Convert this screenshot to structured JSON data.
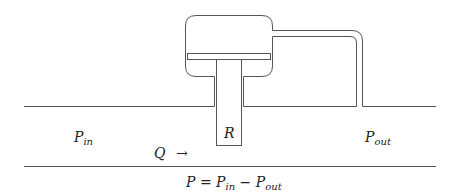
{
  "diagram": {
    "labels": {
      "p_in": {
        "base": "P",
        "sub": "in"
      },
      "p_out": {
        "base": "P",
        "sub": "out"
      },
      "resistance": "R",
      "flow": "Q",
      "flow_arrow": "→"
    },
    "equation": {
      "lhs": "P",
      "equals": "=",
      "term1_base": "P",
      "term1_sub": "in",
      "minus": "−",
      "term2_base": "P",
      "term2_sub": "out"
    },
    "colors": {
      "line": "#555555",
      "background": "#ffffff"
    }
  }
}
